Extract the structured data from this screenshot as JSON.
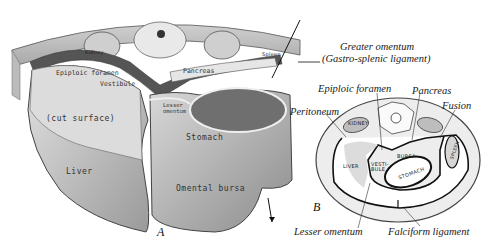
{
  "figure": {
    "panel_a": {
      "letter": "A",
      "labels": {
        "epiploic_foramen": "Epiploic foramen",
        "vestibule": "Vestibule",
        "pancreas": "Pancreas",
        "lesser_omentum": "Lesser omentum",
        "cut_surface": "(cut surface)",
        "stomach": "Stomach",
        "liver": "Liver",
        "omental_bursa": "Omental bursa",
        "kidney": "Kidney",
        "spleen": "Spleen"
      }
    },
    "callouts": {
      "greater_omentum": "Greater omentum",
      "gastro_splenic": "(Gastro-splenic ligament)"
    },
    "panel_b": {
      "letter": "B",
      "labels": {
        "epiploic_foramen": "Epiploic foramen",
        "pancreas": "Pancreas",
        "fusion": "Fusion",
        "peritoneum": "Peritoneum",
        "lesser_omentum": "Lesser omentum",
        "falciform_ligament": "Falciform ligament",
        "kidney": "KIDNEY",
        "liver": "LIVER",
        "vestibule": "VESTI-BULE",
        "bursa": "BURSA",
        "stomach": "STOMACH",
        "spleen": "SPLEEN"
      }
    }
  }
}
